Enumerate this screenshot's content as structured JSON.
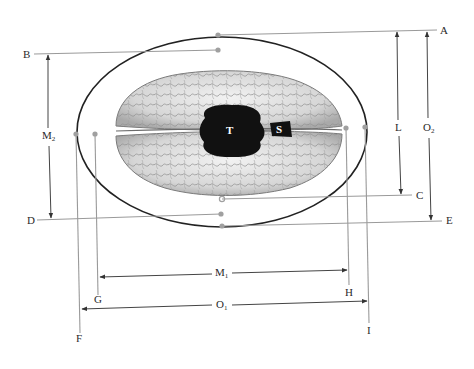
{
  "diagram": {
    "type": "anatomical measurement diagram",
    "colors": {
      "background": "#ffffff",
      "measure_line": "#9a9a9a",
      "ellipse": "#222222",
      "arrow": "#333333",
      "brain_fill": "#d9d9d9",
      "marker_fill": "#111111"
    },
    "markers": [
      {
        "id": "T",
        "label": "T",
        "shape": "large black lobed blob",
        "position": "center of brain"
      },
      {
        "id": "S",
        "label": "S",
        "shape": "small black trapezoid",
        "position": "right of T on midline"
      }
    ],
    "reference_points": [
      {
        "label": "A",
        "side": "top-right",
        "line": "horizontal from top of ellipse"
      },
      {
        "label": "B",
        "side": "top-left",
        "line": "horizontal from top of brain"
      },
      {
        "label": "C",
        "side": "right",
        "line": "horizontal from bottom of brain"
      },
      {
        "label": "D",
        "side": "left",
        "line": "horizontal from lower brain edge"
      },
      {
        "label": "E",
        "side": "bottom-right",
        "line": "horizontal from bottom of ellipse"
      },
      {
        "label": "F",
        "side": "bottom-left",
        "line": "vertical from left of ellipse"
      },
      {
        "label": "G",
        "side": "bottom-left",
        "line": "vertical from left of brain"
      },
      {
        "label": "H",
        "side": "bottom-right",
        "line": "vertical from right of brain"
      },
      {
        "label": "I",
        "side": "bottom-right",
        "line": "vertical from right of ellipse"
      }
    ],
    "measurements": [
      {
        "label": "M",
        "sub": "2",
        "from": "B",
        "to": "D",
        "orientation": "vertical",
        "side": "left"
      },
      {
        "label": "L",
        "sub": "",
        "from": "A",
        "to": "C",
        "orientation": "vertical",
        "side": "right"
      },
      {
        "label": "O",
        "sub": "2",
        "from": "A",
        "to": "E",
        "orientation": "vertical",
        "side": "right"
      },
      {
        "label": "M",
        "sub": "1",
        "from": "G",
        "to": "H",
        "orientation": "horizontal",
        "side": "bottom"
      },
      {
        "label": "O",
        "sub": "1",
        "from": "F",
        "to": "I",
        "orientation": "horizontal",
        "side": "bottom"
      }
    ]
  }
}
